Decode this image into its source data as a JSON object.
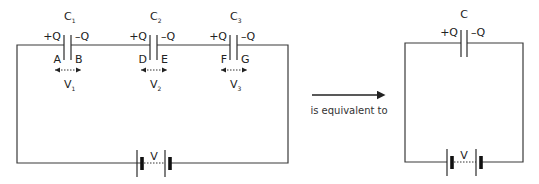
{
  "series_circuit": {
    "capacitors": [
      {
        "name": "C",
        "sub": "1",
        "plus": "+Q",
        "minus": "–Q",
        "left_node": "A",
        "right_node": "B",
        "voltage": "V",
        "voltage_sub": "1"
      },
      {
        "name": "C",
        "sub": "2",
        "plus": "+Q",
        "minus": "–Q",
        "left_node": "D",
        "right_node": "E",
        "voltage": "V",
        "voltage_sub": "2"
      },
      {
        "name": "C",
        "sub": "3",
        "plus": "+Q",
        "minus": "–Q",
        "left_node": "F",
        "right_node": "G",
        "voltage": "V",
        "voltage_sub": "3"
      }
    ],
    "battery_label": "V"
  },
  "arrow": {
    "caption": "is equivalent to"
  },
  "equivalent_circuit": {
    "capacitor": {
      "name": "C",
      "plus": "+Q",
      "minus": "–Q"
    },
    "battery_label": "V"
  },
  "colors": {
    "wire": "#3a3a3a",
    "text": "#222222",
    "background": "#ffffff"
  }
}
